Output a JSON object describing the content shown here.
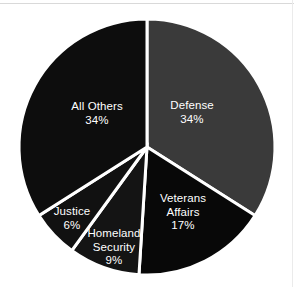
{
  "figure": {
    "background_color": "#ffffff",
    "width": 294,
    "height": 287
  },
  "chart_data": {
    "type": "pie",
    "title": "",
    "subtitle": "",
    "xlabel": "",
    "ylabel": "",
    "legend_position": "none",
    "labels_inside_slices": true,
    "start_angle_deg": 0,
    "direction": "clockwise",
    "categories": [
      "Defense",
      "Veterans Affairs",
      "Homeland Security",
      "Justice",
      "All Others"
    ],
    "values": [
      34,
      17,
      9,
      6,
      34
    ],
    "value_unit": "percent",
    "total": 100,
    "colors": [
      "#3a3a3a",
      "#080808",
      "#141414",
      "#111111",
      "#0d0d0d"
    ],
    "separator_color": "#ffffff",
    "label_color": "#ffffff",
    "slices": [
      {
        "name": "Defense",
        "value": 34,
        "percent_text": "34%",
        "color": "#3a3a3a",
        "start_deg": 0,
        "end_deg": 122.4,
        "label_x": 192,
        "label_y": 112
      },
      {
        "name": "Veterans Affairs",
        "name_line1": "Veterans",
        "name_line2": "Affairs",
        "value": 17,
        "percent_text": "17%",
        "color": "#080808",
        "start_deg": 122.4,
        "end_deg": 183.6,
        "label_x": 183,
        "label_y": 212
      },
      {
        "name": "Homeland Security",
        "name_line1": "Homeland",
        "name_line2": "Security",
        "value": 9,
        "percent_text": "9%",
        "color": "#141414",
        "start_deg": 183.6,
        "end_deg": 216,
        "label_x": 114,
        "label_y": 247
      },
      {
        "name": "Justice",
        "value": 6,
        "percent_text": "6%",
        "color": "#111111",
        "start_deg": 216,
        "end_deg": 237.6,
        "label_x": 72,
        "label_y": 218
      },
      {
        "name": "All Others",
        "value": 34,
        "percent_text": "34%",
        "color": "#0d0d0d",
        "start_deg": 237.6,
        "end_deg": 360,
        "label_x": 97,
        "label_y": 113
      }
    ]
  }
}
